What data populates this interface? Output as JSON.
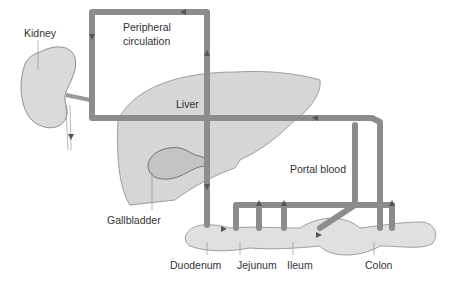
{
  "diagram": {
    "labels": {
      "kidney": "Kidney",
      "peripheral_line1": "Peripheral",
      "peripheral_line2": "circulation",
      "liver": "Liver",
      "gallbladder": "Gallbladder",
      "portal_blood": "Portal blood",
      "duodenum": "Duodenum",
      "jejunum": "Jejunum",
      "ileum": "Ileum",
      "colon": "Colon"
    },
    "colors": {
      "vessel": "#8c8c8c",
      "vessel_dark": "#555555",
      "organ_fill": "#d6d6d6",
      "organ_stroke": "#777777",
      "text": "#333333"
    }
  }
}
